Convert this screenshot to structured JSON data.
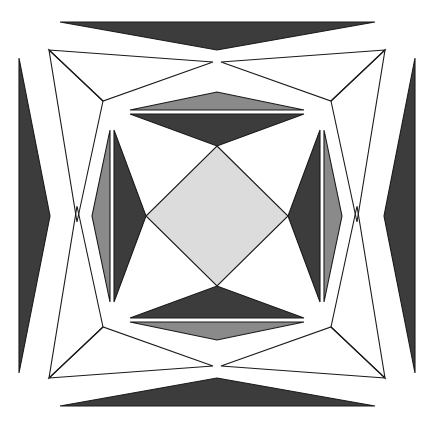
{
  "canvas": {
    "width": 433,
    "height": 427,
    "background": "#ffffff",
    "title": "geometric-polyhedron-projection"
  },
  "palette": {
    "white": "#ffffff",
    "light_gray": "#dcdcdc",
    "medium_gray": "#8a8a8a",
    "dark_gray": "#3c3c3c",
    "outline": "#1a1a1a"
  },
  "figure": {
    "name": "symmetric-polyhedron-star-projection",
    "symmetry": "4-fold rotational",
    "center": {
      "x": 217,
      "y": 216
    },
    "stroke_width": 1.1
  },
  "shapes": {
    "outer_wedges": [
      {
        "name": "outer-wedge-top",
        "fill": "#3c3c3c",
        "points": "60,22 375,22 217,50"
      },
      {
        "name": "outer-wedge-bottom",
        "fill": "#3c3c3c",
        "points": "60,406 375,406 217,378"
      },
      {
        "name": "outer-wedge-left",
        "fill": "#3c3c3c",
        "points": "19,58 19,373 50,216"
      },
      {
        "name": "outer-wedge-right",
        "fill": "#3c3c3c",
        "points": "415,58 415,373 384,216"
      }
    ],
    "corner_fans": [
      {
        "name": "corner-fan-top-left",
        "fill": "#dcdcdc",
        "triangles": [
          {
            "name": "corner-fan-top-left-upper",
            "points": "49,50 213,62 103,101"
          },
          {
            "name": "corner-fan-top-left-lower",
            "points": "49,50 103,101 77,222"
          }
        ]
      },
      {
        "name": "corner-fan-top-right",
        "fill": "#dcdcdc",
        "triangles": [
          {
            "name": "corner-fan-top-right-upper",
            "points": "385,50 221,62 331,101"
          },
          {
            "name": "corner-fan-top-right-lower",
            "points": "385,50 331,101 357,222"
          }
        ]
      },
      {
        "name": "corner-fan-bottom-left",
        "fill": "#dcdcdc",
        "triangles": [
          {
            "name": "corner-fan-bottom-left-lower",
            "points": "49,378 213,366 103,327"
          },
          {
            "name": "corner-fan-bottom-left-upper",
            "points": "49,378 103,327 77,206"
          }
        ]
      },
      {
        "name": "corner-fan-bottom-right",
        "fill": "#dcdcdc",
        "triangles": [
          {
            "name": "corner-fan-bottom-right-lower",
            "points": "385,378 221,366 331,327"
          },
          {
            "name": "corner-fan-bottom-right-upper",
            "points": "385,378 331,327 357,206"
          }
        ]
      }
    ],
    "inner_ring": [
      {
        "name": "inner-face-top-band",
        "fill": "#8a8a8a",
        "points": "130,110 304,110 217,92"
      },
      {
        "name": "inner-face-bottom-band",
        "fill": "#8a8a8a",
        "points": "130,322 304,322 217,340"
      },
      {
        "name": "inner-face-left-band",
        "fill": "#8a8a8a",
        "points": "110,130 110,302 92,216"
      },
      {
        "name": "inner-face-right-band",
        "fill": "#8a8a8a",
        "points": "324,130 324,302 342,216"
      },
      {
        "name": "inner-face-top-dark",
        "fill": "#3c3c3c",
        "points": "130,114 304,114 217,146"
      },
      {
        "name": "inner-face-bottom-dark",
        "fill": "#3c3c3c",
        "points": "130,318 304,318 217,286"
      },
      {
        "name": "inner-face-left-dark",
        "fill": "#3c3c3c",
        "points": "114,130 114,302 146,216"
      },
      {
        "name": "inner-face-right-dark",
        "fill": "#3c3c3c",
        "points": "320,130 320,302 288,216"
      }
    ],
    "center_diamond": {
      "name": "center-diamond",
      "fill": "#dcdcdc",
      "points": "217,146 288,216 217,286 146,216"
    }
  },
  "labels": {
    "caption": ""
  }
}
